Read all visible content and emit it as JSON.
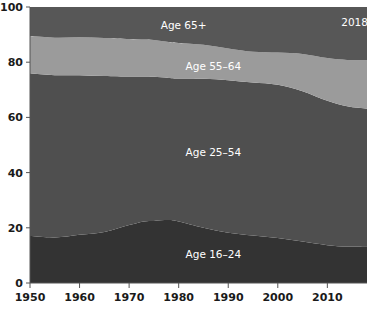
{
  "chart_data": {
    "type": "area",
    "stacked": true,
    "title": "",
    "subtitle": "",
    "xlabel": "",
    "ylabel": "",
    "xlim": [
      1950,
      2018
    ],
    "ylim": [
      0,
      100
    ],
    "grid": false,
    "legend_position": "inline-labels",
    "x_ticks": [
      1950,
      1960,
      1970,
      1980,
      1990,
      2000,
      2010
    ],
    "x_tick_labels": [
      "1950",
      "1960",
      "1970",
      "1980",
      "1990",
      "2000",
      "2010"
    ],
    "y_ticks": [
      0,
      20,
      40,
      60,
      80,
      100
    ],
    "y_tick_labels": [
      "0",
      "20",
      "40",
      "60",
      "80",
      "100"
    ],
    "x": [
      1950,
      1955,
      1960,
      1965,
      1970,
      1973,
      1975,
      1978,
      1980,
      1985,
      1990,
      1995,
      2000,
      2005,
      2010,
      2014,
      2018
    ],
    "series": [
      {
        "name": "Age 16-24",
        "label": "Age 16–24",
        "color": "#333333",
        "label_x": 1987,
        "label_y": 9,
        "values": [
          17.0,
          16.5,
          17.5,
          18.5,
          21.0,
          22.3,
          22.5,
          22.8,
          22.3,
          20.0,
          18.2,
          17.2,
          16.3,
          15.0,
          13.7,
          13.2,
          13.3
        ]
      },
      {
        "name": "Age 25-54",
        "label": "Age 25–54",
        "color": "#4f4f4f",
        "label_x": 1987,
        "label_y": 46,
        "values": [
          59.0,
          58.8,
          57.8,
          56.5,
          53.8,
          52.5,
          52.2,
          51.5,
          51.8,
          54.0,
          55.3,
          55.4,
          55.5,
          54.5,
          52.3,
          50.8,
          49.8
        ]
      },
      {
        "name": "Age 55-64",
        "label": "Age 55–64",
        "color": "#9b9b9b",
        "label_x": 1987,
        "label_y": 77,
        "values": [
          13.5,
          13.6,
          13.7,
          13.8,
          13.6,
          13.4,
          13.3,
          13.0,
          12.9,
          12.3,
          11.5,
          11.2,
          11.7,
          13.5,
          15.5,
          16.8,
          17.6
        ]
      },
      {
        "name": "Age 65+",
        "label": "Age 65+",
        "color": "#575757",
        "label_x": 1981,
        "label_y": 92,
        "values": [
          10.5,
          11.1,
          11.0,
          11.2,
          11.6,
          11.8,
          12.0,
          12.7,
          13.0,
          13.7,
          15.0,
          16.2,
          16.5,
          17.0,
          18.5,
          19.2,
          19.3
        ]
      }
    ],
    "annotations": [
      {
        "name": "year-annotation",
        "text": "2018",
        "x": 2015.5,
        "y": 93,
        "color": "#ffffff"
      }
    ],
    "colors": {
      "background": "#ffffff",
      "axis_text": "#1a1a1a",
      "axis_line": "#555555",
      "label_text": "#ffffff"
    }
  }
}
